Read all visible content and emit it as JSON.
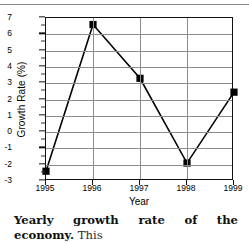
{
  "figure": {
    "caption_bold": "Yearly growth rate of the economy.",
    "caption_rest": "This",
    "caption_line2": "graph indicates a slowdown in economic"
  },
  "chart_data": {
    "type": "line",
    "title": "",
    "xlabel": "Year",
    "ylabel": "Growth Rate (%)",
    "categories": [
      "1995",
      "1996",
      "1997",
      "1998",
      "1999"
    ],
    "x": [
      1995,
      1996,
      1997,
      1998,
      1999
    ],
    "values": [
      -2.4,
      6.6,
      3.3,
      -1.9,
      2.45
    ],
    "series": [
      {
        "name": "Growth Rate",
        "values": [
          -2.4,
          6.6,
          3.3,
          -1.9,
          2.45
        ],
        "marker": "square",
        "marker_color": "#000000",
        "line_color": "#000000"
      }
    ],
    "ylim": [
      -3,
      7
    ],
    "xlim": [
      1995,
      1999
    ],
    "yticks": [
      -3,
      -2,
      -1,
      0,
      1,
      2,
      3,
      4,
      5,
      6,
      7
    ],
    "ytick_labels": [
      "-3",
      "-2",
      "-1",
      "0",
      "1",
      "2",
      "3",
      "4",
      "5",
      "6",
      "7"
    ],
    "xticks": [
      1995,
      1996,
      1997,
      1998,
      1999
    ],
    "xtick_labels": [
      "1995",
      "1996",
      "1997",
      "1998",
      "1999"
    ],
    "grid": true,
    "grid_color": "#8c8c8c",
    "legend": false,
    "legend_position": "none",
    "minor_yticks": true
  }
}
